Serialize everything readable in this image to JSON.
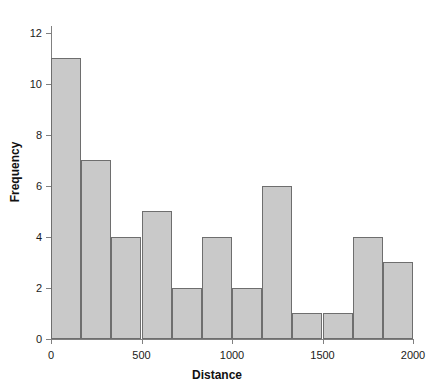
{
  "figure": {
    "ghost_title": "",
    "background_color": "#ffffff"
  },
  "axis_titles": {
    "x": "Distance",
    "y": "Frequency"
  },
  "style": {
    "bar_fill": "#c9c9c9",
    "bar_stroke": "#6e6e6e",
    "axis_color": "#808080",
    "text_color": "#1a1a1a"
  },
  "chart_data": {
    "type": "bar",
    "title": "",
    "subtitle": "",
    "xlabel": "Distance",
    "ylabel": "Frequency",
    "xlim": [
      0,
      2000
    ],
    "ylim": [
      0,
      12.5
    ],
    "grid": false,
    "legend": null,
    "bin_width": 166.6667,
    "bin_edges": [
      0,
      166.67,
      333.33,
      500,
      666.67,
      833.33,
      1000,
      1166.67,
      1333.33,
      1500,
      1666.67,
      1833.33,
      2000
    ],
    "categories": [
      "0-167",
      "167-333",
      "333-500",
      "500-667",
      "667-833",
      "833-1000",
      "1000-1167",
      "1167-1333",
      "1333-1500",
      "1500-1667",
      "1667-1833",
      "1833-2000"
    ],
    "values": [
      11,
      7,
      4,
      5,
      2,
      4,
      2,
      6,
      1,
      1,
      4,
      3
    ],
    "total_count": 50,
    "xticks": [
      0,
      500,
      1000,
      1500,
      2000
    ],
    "xtick_labels": [
      "0",
      "500",
      "1000",
      "1500",
      "2000"
    ],
    "yticks": [
      0,
      2,
      4,
      6,
      8,
      10,
      12
    ],
    "ytick_labels": [
      "0",
      "2",
      "4",
      "6",
      "8",
      "10",
      "12"
    ]
  }
}
